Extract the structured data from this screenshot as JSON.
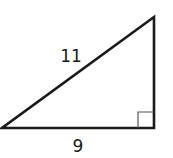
{
  "diagram": {
    "type": "right-triangle",
    "hypotenuse_label": "11",
    "base_label": "9",
    "right_angle_marker": true,
    "stroke_color": "#1a1a1a",
    "marker_color": "#555555"
  }
}
